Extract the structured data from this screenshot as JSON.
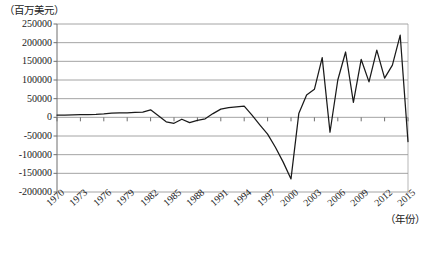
{
  "chart_data": {
    "type": "line",
    "title": "",
    "subtitle": "",
    "ylabel": "（百万美元）",
    "xlabel": "（年份）",
    "ylim": [
      -200000,
      250000
    ],
    "xlim": [
      1970,
      2015
    ],
    "grid": true,
    "legend": null,
    "y_ticks": [
      250000,
      200000,
      150000,
      100000,
      50000,
      0,
      -50000,
      -100000,
      -150000,
      -200000
    ],
    "y_tick_labels": [
      "250000",
      "200000",
      "150000",
      "100000",
      "50000",
      "0",
      "-50000",
      "-100000",
      "-150000",
      "-200000"
    ],
    "x_ticks": [
      1970,
      1973,
      1976,
      1979,
      1982,
      1985,
      1988,
      1991,
      1994,
      1997,
      2000,
      2003,
      2006,
      2009,
      2012,
      2015
    ],
    "x_tick_labels": [
      "1970",
      "1973",
      "1976",
      "1979",
      "1982",
      "1985",
      "1988",
      "1991",
      "1994",
      "1997",
      "2000",
      "2003",
      "2006",
      "2009",
      "2012",
      "2015"
    ],
    "series": [
      {
        "name": "net value",
        "color": "#1a1a1a",
        "x": [
          1970,
          1971,
          1972,
          1973,
          1974,
          1975,
          1976,
          1977,
          1978,
          1979,
          1980,
          1981,
          1982,
          1983,
          1984,
          1985,
          1986,
          1987,
          1988,
          1989,
          1990,
          1991,
          1992,
          1993,
          1994,
          1995,
          1996,
          1997,
          1998,
          1999,
          2000,
          2001,
          2002,
          2003,
          2004,
          2005,
          2006,
          2007,
          2008,
          2009,
          2010,
          2011,
          2012,
          2013,
          2014,
          2015
        ],
        "values": [
          6000,
          6000,
          6500,
          7000,
          7500,
          8000,
          9000,
          11000,
          12000,
          12000,
          13000,
          14000,
          20000,
          4000,
          -12000,
          -16000,
          -5000,
          -14000,
          -8000,
          -4000,
          10000,
          22000,
          26000,
          28000,
          30000,
          6000,
          -20000,
          -45000,
          -80000,
          -120000,
          -165000,
          10000,
          60000,
          75000,
          160000,
          -40000,
          100000,
          175000,
          40000,
          155000,
          95000,
          180000,
          105000,
          140000,
          220000,
          -65000
        ]
      }
    ]
  }
}
